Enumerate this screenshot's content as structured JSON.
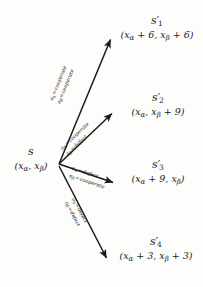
{
  "diagram": {
    "type": "state-transition-tree",
    "title": "",
    "background_color": "#fdfdfb",
    "stroke_color": "#1a1a1a",
    "source": {
      "name": "s",
      "state_label": "s",
      "payoff": "(xα, xβ)",
      "payoff_parts": {
        "open": "(",
        "first_base": "x",
        "first_sub": "α",
        "first_rest": "",
        "comma": ", ",
        "second_base": "x",
        "second_sub": "β",
        "second_rest": "",
        "close": ")"
      }
    },
    "targets": [
      {
        "name": "s1-prime",
        "state_base": "s",
        "state_prime": "′",
        "state_sub": "1",
        "payoff": "(xα + 6, xβ + 6)",
        "payoff_parts": {
          "open": "(",
          "first_base": "x",
          "first_sub": "α",
          "first_rest": " + 6",
          "comma": ", ",
          "second_base": "x",
          "second_sub": "β",
          "second_rest": " + 6",
          "close": ")"
        },
        "edge_label": {
          "alpha_actor": "a",
          "alpha_sub": "α",
          "alpha_eq": "=",
          "alpha_action": "cooperate",
          "beta_actor": "a",
          "beta_sub": "β",
          "beta_eq": "=",
          "beta_action": "cooperate"
        }
      },
      {
        "name": "s2-prime",
        "state_base": "s",
        "state_prime": "′",
        "state_sub": "2",
        "payoff": "(xα, xβ + 9)",
        "payoff_parts": {
          "open": "(",
          "first_base": "x",
          "first_sub": "α",
          "first_rest": "",
          "comma": ", ",
          "second_base": "x",
          "second_sub": "β",
          "second_rest": " + 9",
          "close": ")"
        },
        "edge_label": {
          "alpha_actor": "a",
          "alpha_sub": "α",
          "alpha_eq": "=",
          "alpha_action": "cooperate",
          "beta_actor": "a",
          "beta_sub": "β",
          "beta_eq": "=",
          "beta_action": "defect"
        }
      },
      {
        "name": "s3-prime",
        "state_base": "s",
        "state_prime": "′",
        "state_sub": "3",
        "payoff": "(xα + 9, xβ)",
        "payoff_parts": {
          "open": "(",
          "first_base": "x",
          "first_sub": "α",
          "first_rest": " + 9",
          "comma": ", ",
          "second_base": "x",
          "second_sub": "β",
          "second_rest": "",
          "close": ")"
        },
        "edge_label": {
          "alpha_actor": "a",
          "alpha_sub": "α",
          "alpha_eq": "=",
          "alpha_action": "defect",
          "beta_actor": "a",
          "beta_sub": "β",
          "beta_eq": "=",
          "beta_action": "cooperate"
        }
      },
      {
        "name": "s4-prime",
        "state_base": "s",
        "state_prime": "′",
        "state_sub": "4",
        "payoff": "(xα + 3, xβ + 3)",
        "payoff_parts": {
          "open": "(",
          "first_base": "x",
          "first_sub": "α",
          "first_rest": " + 3",
          "comma": ", ",
          "second_base": "x",
          "second_sub": "β",
          "second_rest": " + 3",
          "close": ")"
        },
        "edge_label": {
          "alpha_actor": "a",
          "alpha_sub": "α",
          "alpha_eq": "=",
          "alpha_action": "defect",
          "beta_actor": "a",
          "beta_sub": "β",
          "beta_eq": "=",
          "beta_action": "defect"
        }
      }
    ]
  }
}
